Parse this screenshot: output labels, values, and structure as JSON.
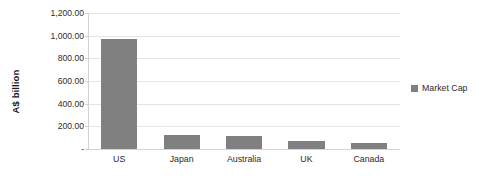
{
  "chart_data": {
    "type": "bar",
    "title": "",
    "subtitle": "",
    "xlabel": "",
    "ylabel": "A$ billion",
    "categories": [
      "US",
      "Japan",
      "Australia",
      "UK",
      "Canada"
    ],
    "series": [
      {
        "name": "Market Cap",
        "values": [
          975,
          120,
          118,
          72,
          50
        ],
        "color": "#808080"
      }
    ],
    "ylim": [
      0,
      1200
    ],
    "ytick_values": [
      1200,
      1000,
      800,
      600,
      400,
      200,
      0
    ],
    "ytick_labels": [
      "1,200.00",
      "1,000.00",
      "800.00",
      "600.00",
      "400.00",
      "200.00",
      "-"
    ],
    "grid": true,
    "grid_color": "#e4e4e4",
    "axis_color": "#d3d3d3",
    "legend_position": "right",
    "legend_entries": [
      "Market Cap"
    ],
    "background": "#ffffff"
  }
}
